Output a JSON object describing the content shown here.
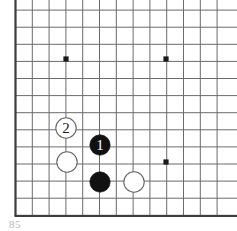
{
  "figure": {
    "caption_partial": "85",
    "background_color": "#ffffff"
  },
  "board": {
    "line_color": "#6b6b6b",
    "edge_color": "#3c3c3c",
    "star_point_color": "#1a1a1a",
    "black_stone_color": "#111111",
    "white_stone_color": "#ffffff",
    "white_stone_border_color": "#666666",
    "origin_x": 15.5,
    "origin_y": -7,
    "cell_size": 16.8,
    "columns": 13,
    "rows": 14,
    "left_edge_x": 15.5,
    "bottom_edge_y": 216,
    "edge_width": 2.2,
    "line_width": 1.0
  },
  "star_points": [
    {
      "name": "star-point-upper-left",
      "x": 66,
      "y": 59,
      "radius": 2.6
    },
    {
      "name": "star-point-upper-right",
      "x": 166,
      "y": 59,
      "radius": 2.6
    },
    {
      "name": "star-point-lower-right",
      "x": 166,
      "y": 162,
      "radius": 2.6
    }
  ],
  "stones": [
    {
      "id": "white-stone-move-2",
      "color": "white",
      "x": 66,
      "y": 128,
      "radius": 10.2,
      "label": "2"
    },
    {
      "id": "white-stone-left",
      "color": "white",
      "x": 67,
      "y": 162,
      "radius": 10.2,
      "label": ""
    },
    {
      "id": "black-stone-move-1",
      "color": "black",
      "x": 100,
      "y": 145,
      "radius": 10.2,
      "label": "1"
    },
    {
      "id": "black-stone-lower",
      "color": "black",
      "x": 100,
      "y": 182,
      "radius": 10.2,
      "label": ""
    },
    {
      "id": "white-stone-lower-right",
      "color": "white",
      "x": 134,
      "y": 182,
      "radius": 10.2,
      "label": ""
    }
  ],
  "move_labels": {
    "move_1": "1",
    "move_2": "2"
  }
}
